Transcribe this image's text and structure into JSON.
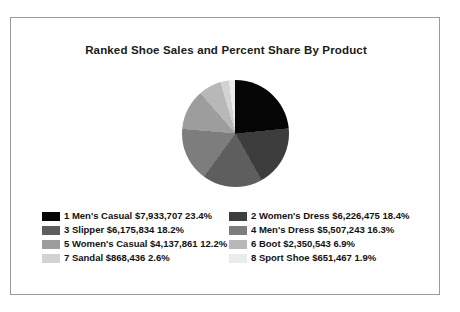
{
  "chart_data": {
    "type": "pie",
    "title": "Ranked Shoe Sales and Percent Share By Product",
    "xlabel": "",
    "ylabel": "",
    "legend_position": "bottom",
    "grid": false,
    "start_angle": 0,
    "direction": "clockwise",
    "categories": [
      "Men's Casual",
      "Women's Dress",
      "Slipper",
      "Men's Dress",
      "Women's Casual",
      "Boot",
      "Sandal",
      "Sport Shoe"
    ],
    "values": [
      7933707,
      6226475,
      6175834,
      5507243,
      4137861,
      2350543,
      868436,
      651467
    ],
    "percents": [
      23.4,
      18.4,
      18.2,
      16.3,
      12.2,
      6.9,
      2.6,
      1.9
    ],
    "colors": [
      "#050505",
      "#3d3d3d",
      "#5e5e5e",
      "#7d7d7d",
      "#9d9d9d",
      "#b8b8b8",
      "#d2d2d2",
      "#ebebeb"
    ],
    "slices": [
      {
        "rank": "1",
        "name": "Men's Casual",
        "value": "$7,933,707",
        "percent": "23.4%",
        "color": "#050505"
      },
      {
        "rank": "2",
        "name": "Women's Dress",
        "value": "$6,226,475",
        "percent": "18.4%",
        "color": "#3d3d3d"
      },
      {
        "rank": "3",
        "name": "Slipper",
        "value": "$6,175,834",
        "percent": "18.2%",
        "color": "#5e5e5e"
      },
      {
        "rank": "4",
        "name": "Men's Dress",
        "value": "$5,507,243",
        "percent": "16.3%",
        "color": "#7d7d7d"
      },
      {
        "rank": "5",
        "name": "Women's Casual",
        "value": "$4,137,861",
        "percent": "12.2%",
        "color": "#9d9d9d"
      },
      {
        "rank": "6",
        "name": "Boot",
        "value": "$2,350,543",
        "percent": "6.9%",
        "color": "#b8b8b8"
      },
      {
        "rank": "7",
        "name": "Sandal",
        "value": "$868,436",
        "percent": "2.6%",
        "color": "#d2d2d2"
      },
      {
        "rank": "8",
        "name": "Sport Shoe",
        "value": "$651,467",
        "percent": "1.9%",
        "color": "#ebebeb"
      }
    ]
  },
  "legend": {
    "entries": [
      {
        "label": "1 Men's Casual $7,933,707 23.4%",
        "color": "#050505"
      },
      {
        "label": "2 Women's Dress $6,226,475 18.4%",
        "color": "#3d3d3d"
      },
      {
        "label": "3 Slipper $6,175,834 18.2%",
        "color": "#5e5e5e"
      },
      {
        "label": "4 Men's Dress $5,507,243 16.3%",
        "color": "#7d7d7d"
      },
      {
        "label": "5 Women's Casual $4,137,861 12.2%",
        "color": "#9d9d9d"
      },
      {
        "label": "6 Boot $2,350,543 6.9%",
        "color": "#b8b8b8"
      },
      {
        "label": "7 Sandal $868,436 2.6%",
        "color": "#d2d2d2"
      },
      {
        "label": "8 Sport Shoe $651,467 1.9%",
        "color": "#ebebeb"
      }
    ]
  }
}
